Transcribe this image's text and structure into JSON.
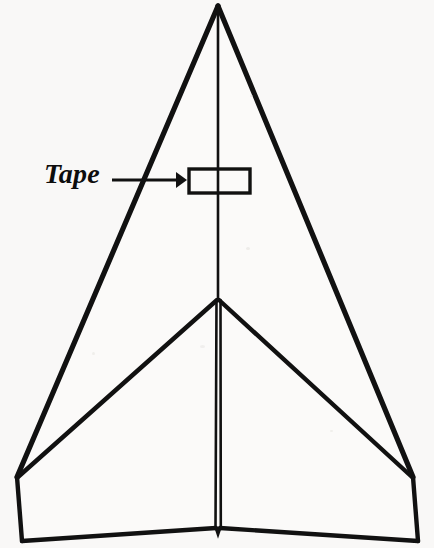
{
  "figure": {
    "background_color": "#f9f8f7",
    "ink_color": "#111111",
    "width": 434,
    "height": 548
  },
  "annotations": {
    "tape_label": "Tape",
    "arrow": {
      "name": "leader-arrow",
      "direction": "right",
      "start_x": 112,
      "end_x": 186,
      "y": 180
    }
  },
  "parts": {
    "tape_patch": {
      "label": "Tape",
      "x": 189,
      "y": 169,
      "width": 61,
      "height": 24
    },
    "nose_apex": {
      "x": 218,
      "y": 5
    },
    "center_junction": {
      "x": 218,
      "y": 300
    },
    "tail_notch": {
      "x": 218,
      "y": 530
    },
    "left_wingtip": {
      "x": 17,
      "y": 477
    },
    "right_wingtip": {
      "x": 413,
      "y": 477
    },
    "left_tail_corner": {
      "x": 22,
      "y": 540
    },
    "right_tail_corner": {
      "x": 418,
      "y": 541
    }
  },
  "geometry": {
    "outer_left_edge": "218,5 17,477",
    "outer_right_edge": "218,5 413,477",
    "left_fold_edge": "218,300 17,477",
    "right_fold_edge": "218,300 413,477",
    "left_winglet": "17,477 22,540",
    "right_winglet": "413,477 418,541",
    "left_trailing_edge": "22,540 216,528",
    "right_trailing_edge": "220,528 418,541",
    "spine_upper": "218,5 218,300",
    "spine_left": "216,300 215,528",
    "spine_right": "221,300 221,528"
  }
}
